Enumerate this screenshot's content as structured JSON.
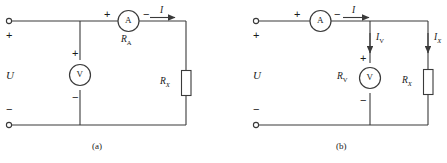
{
  "figure": {
    "stroke_color": "#3a3a3a",
    "text_color": "#1a1a1a",
    "background": "#ffffff"
  },
  "circuits": [
    {
      "id": "circuit-a",
      "caption": "(a)",
      "source_label": "U",
      "terminal_plus": "+",
      "terminal_minus": "−",
      "ammeter": {
        "symbol": "A",
        "plus": "+",
        "minus": "−",
        "resistance_label": "R",
        "resistance_sub": "A"
      },
      "voltmeter": {
        "symbol": "V",
        "plus": "+",
        "minus": "−"
      },
      "resistor": {
        "label": "R",
        "sub": "X"
      },
      "current": {
        "label": "I"
      }
    },
    {
      "id": "circuit-b",
      "caption": "(b)",
      "source_label": "U",
      "terminal_plus": "+",
      "terminal_minus": "−",
      "ammeter": {
        "symbol": "A",
        "plus": "+",
        "minus": "−"
      },
      "voltmeter": {
        "symbol": "V",
        "plus": "+",
        "minus": "−",
        "resistance_label": "R",
        "resistance_sub": "V"
      },
      "resistor": {
        "label": "R",
        "sub": "X"
      },
      "currents": [
        {
          "label": "I",
          "sub": ""
        },
        {
          "label": "I",
          "sub": "V"
        },
        {
          "label": "I",
          "sub": "X"
        }
      ]
    }
  ]
}
